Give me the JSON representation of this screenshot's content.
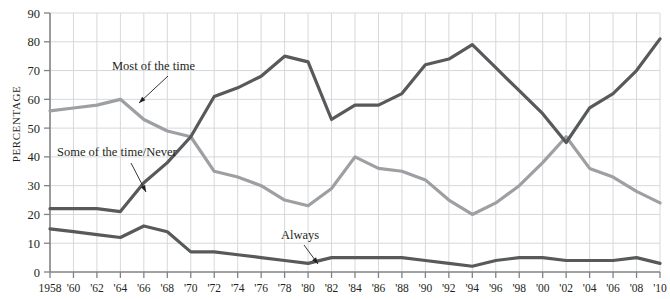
{
  "axis": {
    "ylabel": "PERCENTAGE",
    "yticks": [
      "0",
      "10",
      "20",
      "30",
      "40",
      "50",
      "60",
      "70",
      "80",
      "90"
    ],
    "xticks": [
      "1958",
      "'60",
      "'62",
      "'64",
      "'66",
      "'68",
      "'70",
      "'72",
      "'74",
      "'76",
      "'78",
      "'80",
      "'82",
      "'84",
      "'86",
      "'88",
      "'90",
      "'92",
      "'94",
      "'96",
      "'98",
      "'00",
      "'02",
      "'04",
      "'06",
      "'08",
      "'10"
    ]
  },
  "annotations": [
    {
      "id": "most-of-the-time",
      "label": "Most of the time",
      "x": 112,
      "y": 70,
      "lx1": 168,
      "ly1": 76,
      "lx2": 139,
      "ly2": 103
    },
    {
      "id": "some-of-the-time-never",
      "label": "Some of the time/Never",
      "x": 57,
      "y": 156,
      "lx1": 131,
      "ly1": 163,
      "lx2": 146,
      "ly2": 192
    },
    {
      "id": "always",
      "label": "Always",
      "x": 281,
      "y": 239,
      "lx1": 304,
      "ly1": 245,
      "lx2": 318,
      "ly2": 264
    }
  ],
  "colors": {
    "most_of_the_time": "#9d9fa2",
    "some_of_the_time_never": "#58595b",
    "always": "#58595b",
    "grid": "#d7d8da",
    "axis": "#808285",
    "text": "#231f20"
  },
  "chart_data": {
    "type": "line",
    "title": "",
    "xlabel": "",
    "ylabel": "PERCENTAGE",
    "ylim": [
      0,
      90
    ],
    "xlim": [
      1958,
      2010
    ],
    "grid": true,
    "legend": "inline-annotations",
    "x": [
      1958,
      1960,
      1962,
      1964,
      1966,
      1968,
      1970,
      1972,
      1974,
      1976,
      1978,
      1980,
      1982,
      1984,
      1986,
      1988,
      1990,
      1992,
      1994,
      1996,
      1998,
      2000,
      2002,
      2004,
      2006,
      2008,
      2010
    ],
    "series": [
      {
        "name": "Most of the time",
        "color": "#9d9fa2",
        "values": [
          56,
          57,
          58,
          60,
          53,
          49,
          47,
          35,
          33,
          30,
          25,
          23,
          29,
          40,
          36,
          35,
          32,
          25,
          20,
          24,
          30,
          38,
          47,
          36,
          33,
          28,
          24
        ]
      },
      {
        "name": "Some of the time/Never",
        "color": "#58595b",
        "values": [
          22,
          22,
          22,
          21,
          31,
          38,
          47,
          61,
          64,
          68,
          75,
          73,
          53,
          58,
          58,
          62,
          72,
          74,
          79,
          71,
          63,
          55,
          45,
          57,
          62,
          70,
          81
        ]
      },
      {
        "name": "Always",
        "color": "#58595b",
        "values": [
          15,
          14,
          13,
          12,
          16,
          14,
          7,
          7,
          6,
          5,
          4,
          3,
          5,
          5,
          5,
          5,
          4,
          3,
          2,
          4,
          5,
          5,
          4,
          4,
          4,
          5,
          3
        ]
      }
    ]
  }
}
